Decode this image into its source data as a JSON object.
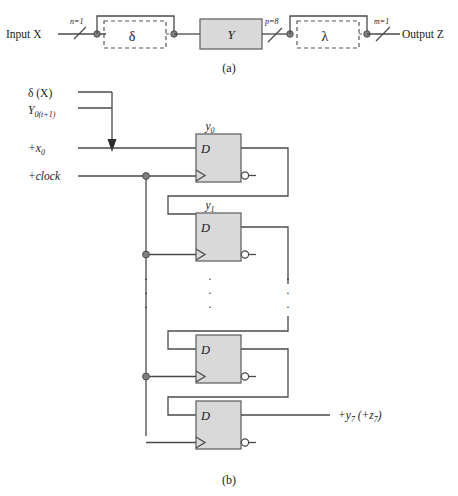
{
  "figure": {
    "part_a": {
      "caption": "(a)",
      "input_label": "Input X",
      "output_label": "Output Z",
      "bus_n": "n=1",
      "bus_p": "p=8",
      "bus_m": "m=1",
      "block_delta": "δ",
      "block_y": "Y",
      "block_lambda": "λ"
    },
    "part_b": {
      "caption": "(b)",
      "label_delta_x": "δ (X)",
      "label_y_next_main": "Y",
      "label_y_next_sub": "0(t+1)",
      "label_x0_sign": "+x",
      "label_x0_sub": "0",
      "label_clock": "+clock",
      "output_main": "+y",
      "output_sub1": "7",
      "output_paren_open": " (+z",
      "output_sub2": "7",
      "output_paren_close": ")",
      "flipflops": [
        {
          "name": "y",
          "index": "0",
          "d": "D"
        },
        {
          "name": "y",
          "index": "1",
          "d": "D"
        },
        {
          "name": "y",
          "index": "6",
          "d": "D"
        },
        {
          "name": "y",
          "index": "7",
          "d": "D"
        }
      ],
      "ellipsis_dot": "·"
    },
    "colors": {
      "line": "#4a4a4a",
      "block_fill": "#d9d9d9",
      "block_stroke": "#666666",
      "dashed_stroke": "#555555",
      "text": "#1a1a1a",
      "node_fill": "#808080"
    }
  }
}
